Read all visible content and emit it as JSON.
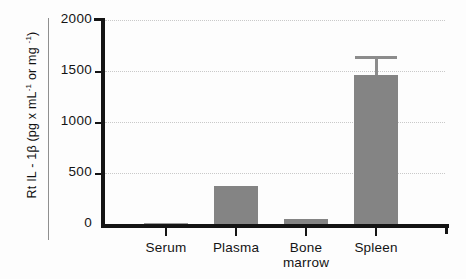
{
  "chart_data": {
    "type": "bar",
    "title": "",
    "xlabel": "",
    "ylabel": "Rt IL - 1β   (pg x mL⁻¹ or mg ⁻¹)",
    "ylabel_parts": {
      "main": "Rt IL - 1β",
      "units_prefix": "  (pg x mL",
      "sup1": "-1",
      "units_mid": " or mg ",
      "sup2": "-1",
      "units_suffix": ")"
    },
    "categories": [
      "Serum",
      "Plasma",
      "Bone\nmarrow",
      "Spleen"
    ],
    "values": [
      0,
      375,
      45,
      1460
    ],
    "errors": [
      0,
      0,
      0,
      190
    ],
    "ylim": [
      0,
      2000
    ],
    "yticks": [
      0,
      500,
      1000,
      1500,
      2000
    ],
    "ytick_labels": [
      "0",
      "500",
      "1000",
      "1500",
      "2000"
    ],
    "grid": "horizontal-dotted",
    "legend": "none",
    "bar_color": "#848484",
    "error_color": "#8c8c8c",
    "axis_color": "#141414",
    "grid_color": "#c9c9c9",
    "background": "#fdfdfd"
  }
}
